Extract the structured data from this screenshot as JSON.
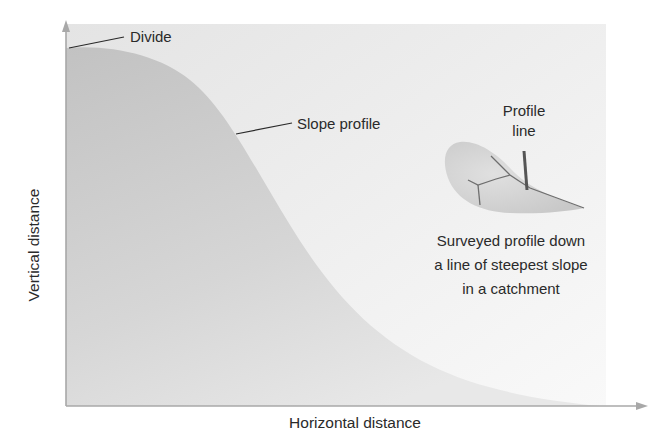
{
  "figure": {
    "axes": {
      "x_label": "Horizontal distance",
      "y_label": "Vertical distance"
    },
    "annotations": {
      "divide": "Divide",
      "slope_profile": "Slope profile",
      "profile_line_1": "Profile",
      "profile_line_2": "line",
      "caption_line_1": "Surveyed profile down",
      "caption_line_2": "a line of steepest slope",
      "caption_line_3": "in a catchment"
    },
    "colors": {
      "background_panel_top": "#e6e6e6",
      "background_panel_bottom": "#f7f7f7",
      "slope_fill_top": "#c4c4c4",
      "slope_fill_bottom": "#e4e4e4",
      "catchment_fill": "#d0d0d0",
      "axis": "#a8a8a8",
      "leader_line": "#2a2a2a",
      "text": "#2a2a2a"
    }
  }
}
